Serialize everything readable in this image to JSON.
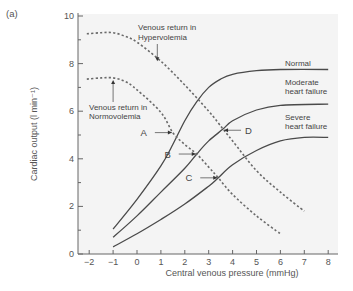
{
  "panel_label": "(a)",
  "chart_data": {
    "type": "line",
    "title": "",
    "xlabel": "Central venous pressure (mmHg)",
    "ylabel": "Cardiac output (l min⁻¹)",
    "xlim": [
      -2.3,
      8.4
    ],
    "ylim": [
      0,
      10
    ],
    "xticks": [
      -2,
      -1,
      0,
      1,
      2,
      3,
      4,
      5,
      6,
      7,
      8
    ],
    "yticks_major": [
      0,
      2,
      4,
      6,
      8,
      10
    ],
    "yticks_minor": [
      1,
      3,
      5,
      7,
      9
    ],
    "grid": false,
    "legend": "none (inline labels)",
    "series": [
      {
        "name": "Normal",
        "style": "solid",
        "points": [
          [
            -1,
            1.05
          ],
          [
            0,
            2.3
          ],
          [
            1,
            3.7
          ],
          [
            1.5,
            4.6
          ],
          [
            2,
            5.6
          ],
          [
            2.5,
            6.4
          ],
          [
            3,
            7.0
          ],
          [
            3.5,
            7.35
          ],
          [
            4,
            7.55
          ],
          [
            5,
            7.7
          ],
          [
            6,
            7.75
          ],
          [
            8,
            7.75
          ]
        ]
      },
      {
        "name": "Moderate heart failure",
        "style": "solid",
        "points": [
          [
            -1,
            0.7
          ],
          [
            0,
            1.6
          ],
          [
            1,
            2.6
          ],
          [
            2,
            3.6
          ],
          [
            2.5,
            4.2
          ],
          [
            3,
            4.75
          ],
          [
            3.6,
            5.25
          ],
          [
            4,
            5.6
          ],
          [
            5,
            6.05
          ],
          [
            6,
            6.25
          ],
          [
            8,
            6.3
          ]
        ]
      },
      {
        "name": "Severe heart failure",
        "style": "solid",
        "points": [
          [
            -1,
            0.3
          ],
          [
            0,
            0.85
          ],
          [
            1,
            1.45
          ],
          [
            2,
            2.1
          ],
          [
            3,
            2.85
          ],
          [
            3.4,
            3.2
          ],
          [
            4,
            3.75
          ],
          [
            5,
            4.35
          ],
          [
            6,
            4.75
          ],
          [
            7,
            4.9
          ],
          [
            8,
            4.9
          ]
        ]
      },
      {
        "name": "Venous return in Hypervolemia",
        "style": "dashed",
        "points": [
          [
            -2.1,
            9.25
          ],
          [
            -1.5,
            9.3
          ],
          [
            -1,
            9.3
          ],
          [
            -0.5,
            9.15
          ],
          [
            0,
            8.9
          ],
          [
            1,
            8.1
          ],
          [
            2,
            7.1
          ],
          [
            3,
            6.0
          ],
          [
            3.6,
            5.25
          ],
          [
            4,
            4.75
          ],
          [
            5,
            3.5
          ],
          [
            6,
            2.6
          ],
          [
            7,
            1.8
          ]
        ]
      },
      {
        "name": "Venous return in Normovolemia",
        "style": "dashed",
        "points": [
          [
            -2.1,
            7.35
          ],
          [
            -1.5,
            7.4
          ],
          [
            -1,
            7.4
          ],
          [
            -0.5,
            7.25
          ],
          [
            0,
            6.9
          ],
          [
            1,
            5.95
          ],
          [
            1.5,
            5.1
          ],
          [
            2,
            4.6
          ],
          [
            2.5,
            4.2
          ],
          [
            3,
            3.65
          ],
          [
            3.4,
            3.2
          ],
          [
            4,
            2.5
          ],
          [
            5,
            1.6
          ],
          [
            6,
            0.85
          ]
        ]
      }
    ],
    "equilibrium_points": [
      {
        "label": "A",
        "x": 1.5,
        "y": 5.1
      },
      {
        "label": "B",
        "x": 2.5,
        "y": 4.2
      },
      {
        "label": "C",
        "x": 3.4,
        "y": 3.2
      },
      {
        "label": "D",
        "x": 3.6,
        "y": 5.2
      }
    ],
    "annotations": [
      {
        "text": [
          "Venous return in",
          "Hypervolemia"
        ],
        "arrow_to": [
          0.85,
          8.1
        ]
      },
      {
        "text": [
          "Venous return in",
          "Normovolemia"
        ],
        "arrow_to": [
          -1.0,
          7.35
        ]
      },
      {
        "text": [
          "Normal"
        ],
        "series": "Normal"
      },
      {
        "text": [
          "Moderate",
          "heart failure"
        ],
        "series": "Moderate heart failure"
      },
      {
        "text": [
          "Severe",
          "heart failure"
        ],
        "series": "Severe heart failure"
      }
    ]
  },
  "style": {
    "plot_bg": "#f4f4f4",
    "axis_color": "#666666",
    "curve_color": "#4a4a4a",
    "dash_color": "#6a6a6a",
    "text_color": "#555555"
  }
}
